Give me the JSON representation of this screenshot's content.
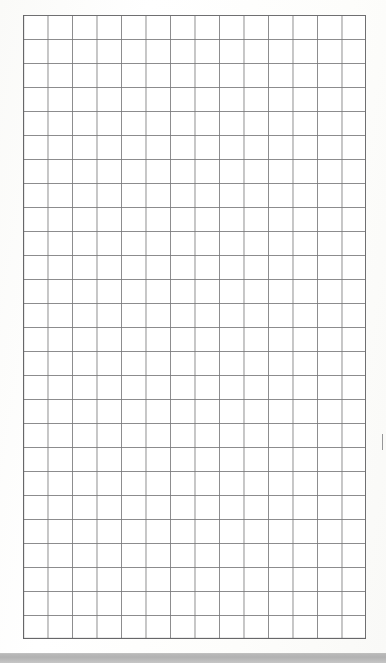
{
  "document": {
    "kind": "scanned-graph-paper",
    "title": "",
    "visible_text": "",
    "page_background_color": "#fefefe"
  },
  "grid": {
    "name": "graph-paper-grid",
    "columns": 14,
    "rows": 26,
    "cell_width_px": 24.5,
    "cell_height_px": 24.0,
    "left_px": 23,
    "top_px": 15,
    "width_px": 343,
    "height_px": 624,
    "line_color": "#78787a",
    "border_color": "#6f6f71",
    "border_width_px": 1.4,
    "fill_color": "#ffffff",
    "cells_filled": 0,
    "labels": []
  },
  "marks": [
    {
      "name": "stray-mark",
      "description": "faint vertical pencil speck in the right margin",
      "left_px": 382,
      "top_px": 434,
      "width_px": 1,
      "height_px": 16,
      "color": "#969698"
    }
  ],
  "bottom_band": {
    "name": "scan-edge-band",
    "top_px": 654,
    "height_px": 9,
    "color": "#b5b5b5"
  }
}
